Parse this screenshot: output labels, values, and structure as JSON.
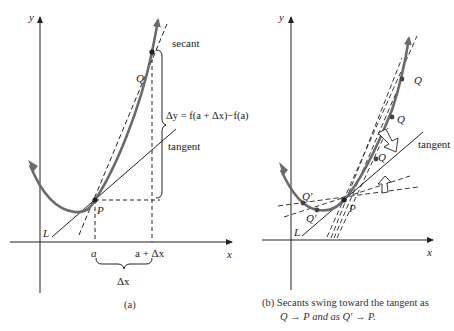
{
  "panel_a": {
    "axis_y_label": "y",
    "axis_x_label": "x",
    "secant_label": "secant",
    "tangent_label": "tangent",
    "delta_y_label": "Δy = f(a + Δx)−f(a)",
    "point_q": "Q",
    "point_p": "P",
    "line_l": "L",
    "tick_a": "a",
    "tick_a_plus_dx": "a + Δx",
    "delta_x_label": "Δx",
    "caption": "(a)"
  },
  "panel_b": {
    "axis_y_label": "y",
    "axis_x_label": "x",
    "tangent_label": "tangent",
    "point_q1": "Q",
    "point_q2": "Q",
    "point_q3": "Q",
    "point_q_prime_1": "Q'",
    "point_q_prime_2": "Q'",
    "point_p": "P",
    "line_l": "L",
    "caption_line1": "(b)  Secants swing toward the tangent as",
    "caption_line2": "Q → P and as Q' → P."
  },
  "colors": {
    "curve": "#6b6b6b",
    "lines": "#222222"
  }
}
